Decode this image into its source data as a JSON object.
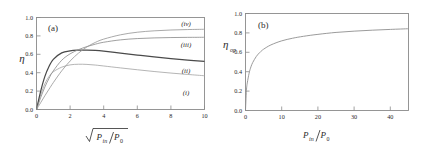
{
  "figure": {
    "panels": [
      "a",
      "b"
    ]
  },
  "panel_a": {
    "tag": "(a)",
    "ylabel": "η",
    "xlabel_num": "P",
    "xlabel_num_sub": "in",
    "xlabel_den": "P",
    "xlabel_den_sub": "0",
    "xticks": [
      "0",
      "2",
      "4",
      "6",
      "8",
      "10"
    ],
    "yticks": [
      "0.0",
      "0.2",
      "0.4",
      "0.6",
      "0.8",
      "1.0"
    ],
    "curve_labels": [
      "(i)",
      "(ii)",
      "(iii)",
      "(iv)"
    ]
  },
  "panel_b": {
    "tag": "(b)",
    "ylabel_base": "η",
    "ylabel_sub": "op",
    "xlabel_num": "P",
    "xlabel_num_sub": "in",
    "xlabel_den": "P",
    "xlabel_den_sub": "0",
    "xticks": [
      "0",
      "10",
      "20",
      "30",
      "40"
    ],
    "yticks": [
      "0.0",
      "0.2",
      "0.4",
      "0.6",
      "0.8",
      "1.0"
    ]
  },
  "colors": {
    "frame": "#8a8a8a",
    "text": "#2b2b2b",
    "curve_i": "#a8a8a8",
    "curve_ii": "#4a4a4a",
    "curve_iii": "#8f8f8f",
    "curve_iv": "#9a9a9a",
    "curve_b": "#8f8f8f"
  },
  "chart_data": [
    {
      "type": "line",
      "title": "(a)",
      "xlabel": "sqrt(P_in/P_0)",
      "ylabel": "eta",
      "xlim": [
        0,
        10
      ],
      "ylim": [
        0,
        1.0
      ],
      "grid": false,
      "legend": "inline-right-labels",
      "xticks": [
        0,
        2,
        4,
        6,
        8,
        10
      ],
      "yticks": [
        0.0,
        0.2,
        0.4,
        0.6,
        0.8,
        1.0
      ],
      "x": [
        0,
        0.25,
        0.5,
        0.75,
        1.0,
        1.5,
        2.0,
        2.5,
        3.0,
        3.5,
        4.0,
        5.0,
        6.0,
        7.0,
        8.0,
        9.0,
        10.0
      ],
      "series": [
        {
          "name": "(i)",
          "label": "(i)",
          "values": [
            0.0,
            0.16,
            0.28,
            0.36,
            0.41,
            0.46,
            0.485,
            0.492,
            0.49,
            0.483,
            0.473,
            0.452,
            0.432,
            0.413,
            0.396,
            0.381,
            0.367
          ]
        },
        {
          "name": "(ii)",
          "label": "(ii)",
          "values": [
            0.0,
            0.2,
            0.36,
            0.47,
            0.545,
            0.615,
            0.638,
            0.645,
            0.646,
            0.642,
            0.634,
            0.613,
            0.592,
            0.572,
            0.554,
            0.537,
            0.522
          ]
        },
        {
          "name": "(iii)",
          "label": "(iii)",
          "values": [
            0.0,
            0.13,
            0.245,
            0.34,
            0.42,
            0.535,
            0.605,
            0.65,
            0.684,
            0.71,
            0.731,
            0.757,
            0.771,
            0.778,
            0.782,
            0.784,
            0.785
          ]
        },
        {
          "name": "(iv)",
          "label": "(iv)",
          "values": [
            0.0,
            0.075,
            0.15,
            0.222,
            0.292,
            0.42,
            0.527,
            0.613,
            0.68,
            0.729,
            0.765,
            0.812,
            0.84,
            0.855,
            0.864,
            0.869,
            0.872
          ]
        }
      ]
    },
    {
      "type": "line",
      "title": "(b)",
      "xlabel": "P_in/P_0",
      "ylabel": "eta_op",
      "xlim": [
        0,
        45
      ],
      "ylim": [
        0,
        1.0
      ],
      "grid": false,
      "legend": "none",
      "xticks": [
        0,
        10,
        20,
        30,
        40
      ],
      "yticks": [
        0.0,
        0.2,
        0.4,
        0.6,
        0.8,
        1.0
      ],
      "x": [
        0,
        0.25,
        0.5,
        1.0,
        1.5,
        2.0,
        3.0,
        4.0,
        5.0,
        7.0,
        10.0,
        13.0,
        16.0,
        20.0,
        25.0,
        30.0,
        35.0,
        40.0,
        45.0
      ],
      "values": [
        0.0,
        0.205,
        0.285,
        0.385,
        0.45,
        0.495,
        0.558,
        0.6,
        0.632,
        0.676,
        0.718,
        0.745,
        0.765,
        0.785,
        0.805,
        0.818,
        0.828,
        0.836,
        0.843
      ]
    }
  ]
}
